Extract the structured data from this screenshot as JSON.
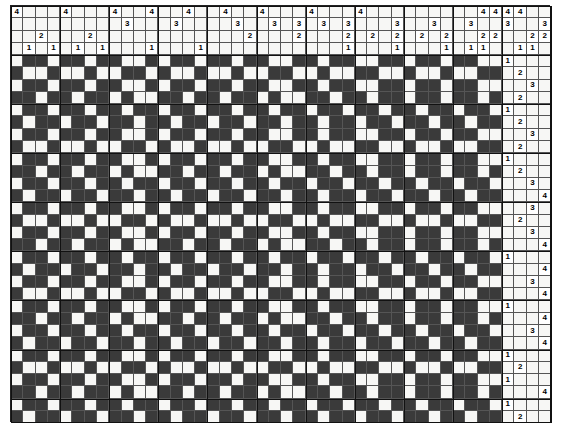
{
  "document": {
    "title": "Weaving Draft",
    "type": "four-shaft-draft"
  },
  "geometry": {
    "cell_w": 12.28,
    "cell_h": 12.27,
    "threading_cols": 40,
    "threading_rows": 4,
    "treadling_cols": 4,
    "drawdown_rows": 30,
    "origin_x": 10,
    "origin_y": 5
  },
  "palette": {
    "filled": "#3a3a3a",
    "empty": "#f7f7f5",
    "mark_bg": "#ffffff",
    "grid_line": "#555555",
    "frame_line": "#111111",
    "text": "#000000",
    "page": "#ffffff"
  },
  "threading": {
    "label": "threading",
    "shaft_labels": [
      "4",
      "3",
      "2",
      "1"
    ],
    "rows": [
      {
        "shaft": "4",
        "cols": [
          0,
          4,
          8,
          11,
          14,
          17,
          20,
          24,
          28,
          38,
          39
        ]
      },
      {
        "shaft": "3",
        "cols": [
          9,
          13,
          18,
          21,
          23,
          25,
          27,
          31,
          34,
          37,
          40
        ]
      },
      {
        "shaft": "2",
        "cols": [
          2,
          6,
          19,
          23,
          27,
          29,
          31,
          33,
          35,
          38,
          39
        ]
      },
      {
        "shaft": "1",
        "cols": [
          1,
          3,
          5,
          7,
          11,
          15,
          27,
          31,
          35,
          37,
          38
        ]
      }
    ]
  },
  "treadling": {
    "label": "treadling",
    "treadle_labels": [
      "1",
      "2",
      "3",
      "4"
    ],
    "rows": [
      {
        "index": 0,
        "treadle": "1"
      },
      {
        "index": 1,
        "treadle": "2"
      },
      {
        "index": 2,
        "treadle": "3"
      },
      {
        "index": 3,
        "treadle": "2"
      },
      {
        "index": 4,
        "treadle": "1"
      },
      {
        "index": 5,
        "treadle": "2"
      },
      {
        "index": 6,
        "treadle": "3"
      },
      {
        "index": 7,
        "treadle": "2"
      },
      {
        "index": 8,
        "treadle": "1"
      },
      {
        "index": 9,
        "treadle": "2"
      },
      {
        "index": 10,
        "treadle": "3"
      },
      {
        "index": 11,
        "treadle": "4"
      },
      {
        "index": 12,
        "treadle": "3"
      },
      {
        "index": 13,
        "treadle": "2"
      },
      {
        "index": 14,
        "treadle": "3"
      },
      {
        "index": 15,
        "treadle": "4"
      },
      {
        "index": 16,
        "treadle": "1"
      },
      {
        "index": 17,
        "treadle": "4"
      },
      {
        "index": 18,
        "treadle": "3"
      },
      {
        "index": 19,
        "treadle": "4"
      },
      {
        "index": 20,
        "treadle": "1"
      },
      {
        "index": 21,
        "treadle": "4"
      },
      {
        "index": 22,
        "treadle": "3"
      },
      {
        "index": 23,
        "treadle": "4"
      },
      {
        "index": 24,
        "treadle": "1"
      },
      {
        "index": 25,
        "treadle": "2"
      },
      {
        "index": 26,
        "treadle": "1"
      },
      {
        "index": 27,
        "treadle": "4"
      },
      {
        "index": 28,
        "treadle": "1"
      },
      {
        "index": 29,
        "treadle": "2"
      },
      {
        "index": 30,
        "treadle": "1"
      },
      {
        "index": 31,
        "treadle": "4"
      }
    ]
  },
  "drawdown": {
    "label": "drawdown-pattern",
    "cols": 40,
    "rows": 30,
    "note": "1 = warp up (dark), 0 = weft up (light)",
    "matrix": [
      "0110110110010110110110011011001101101100",
      "1001001001101001001001100100110010010011",
      "0110110110010110110110011011001101101100",
      "1101101101001101101101001101101101101101",
      "0110110110110110110110110110110110110110",
      "1011011011011011011011011011011011011011",
      "0110110110010110110110011011001101101100",
      "1001001001101001001001100100110010010011",
      "0110110110010110110110011011001101101100",
      "1101101101001101101101001101101101101101",
      "0110110110110110110110110110110110110110",
      "1011011011011011011011011011011011011011",
      "0110110110010110110110011011001101101100",
      "1001001001101001001001100100110010010011",
      "0110110110010110110110011011001101101100",
      "1101101101001101101101001101101101101101",
      "0110110110110110110110110110110110110110",
      "1011011011011011011011011011011011011011",
      "0110110110010110110110011011001101101100",
      "1001001001101001001001100100110010010011",
      "0110110110010110110110011011001101101100",
      "1101101101001101101101001101101101101101",
      "0110110110110110110110110110110110110110",
      "1011011011011011011011011011011011011011",
      "0110110110010110110110011011001101101100",
      "1001001001101001001001100100110010010011",
      "0110110110010110110110011011001101101100",
      "1101101101001101101101001101101101101101",
      "0110110110110110110110110110110110110110",
      "1011011011011011011011011011011011011011"
    ]
  }
}
